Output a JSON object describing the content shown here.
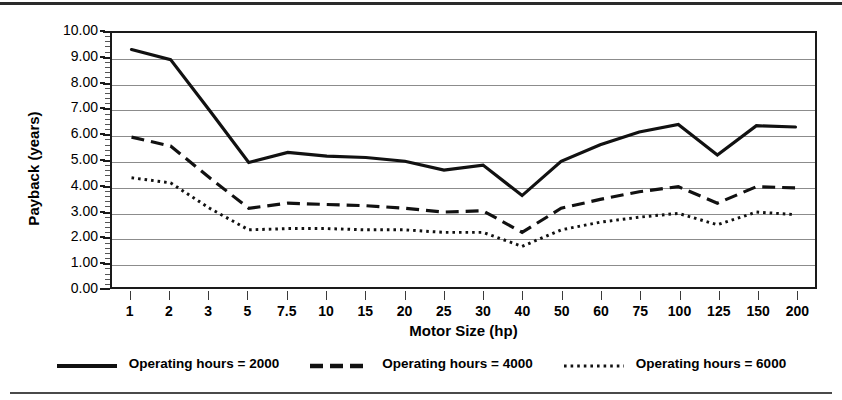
{
  "chart_data": {
    "type": "line",
    "title": "",
    "xlabel": "Motor Size (hp)",
    "ylabel": "Payback (years)",
    "categories": [
      "1",
      "2",
      "3",
      "5",
      "7.5",
      "10",
      "15",
      "20",
      "25",
      "30",
      "40",
      "50",
      "60",
      "75",
      "100",
      "125",
      "150",
      "200"
    ],
    "ylim": [
      0,
      10
    ],
    "ytick_labels": [
      "10.00",
      "9.00",
      "8.00",
      "7.00",
      "6.00",
      "5.00",
      "4.00",
      "3.00",
      "2.00",
      "1.00",
      "0.00"
    ],
    "ytick_values": [
      10,
      9,
      8,
      7,
      6,
      5,
      4,
      3,
      2,
      1,
      0
    ],
    "ytick_step": 1,
    "yminor_step": 0.2,
    "grid": "horizontal",
    "legend_position": "bottom",
    "series": [
      {
        "name": "Operating hours = 2000",
        "style": "solid",
        "color": "#111111",
        "width": 3.2,
        "values": [
          9.35,
          8.95,
          6.95,
          4.9,
          5.3,
          5.15,
          5.1,
          4.95,
          4.6,
          4.8,
          3.6,
          4.95,
          5.6,
          6.1,
          6.4,
          5.2,
          6.35,
          6.3
        ]
      },
      {
        "name": "Operating hours = 4000",
        "style": "dashed",
        "color": "#111111",
        "width": 3.2,
        "values": [
          5.9,
          5.55,
          4.3,
          3.1,
          3.3,
          3.25,
          3.2,
          3.1,
          2.95,
          3.0,
          2.15,
          3.1,
          3.45,
          3.75,
          3.95,
          3.3,
          3.95,
          3.9
        ]
      },
      {
        "name": "Operating hours = 6000",
        "style": "dotted",
        "color": "#111111",
        "width": 3.0,
        "values": [
          4.3,
          4.1,
          3.1,
          2.25,
          2.3,
          2.3,
          2.25,
          2.25,
          2.15,
          2.15,
          1.6,
          2.25,
          2.55,
          2.75,
          2.9,
          2.45,
          2.95,
          2.85
        ]
      }
    ]
  },
  "legend": {
    "items": [
      {
        "label": "Operating hours = 2000",
        "style": "solid"
      },
      {
        "label": "Operating hours = 4000",
        "style": "dashed"
      },
      {
        "label": "Operating hours = 6000",
        "style": "dotted"
      }
    ]
  },
  "axes": {
    "x_title": "Motor Size (hp)",
    "y_title": "Payback (years)"
  }
}
